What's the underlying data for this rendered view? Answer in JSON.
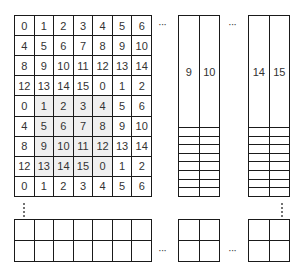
{
  "diagram": {
    "main_grid": {
      "columns": 7,
      "rows": [
        [
          "0",
          "1",
          "2",
          "3",
          "4",
          "5",
          "6"
        ],
        [
          "4",
          "5",
          "6",
          "7",
          "8",
          "9",
          "10"
        ],
        [
          "8",
          "9",
          "10",
          "11",
          "12",
          "13",
          "14"
        ],
        [
          "12",
          "13",
          "14",
          "15",
          "0",
          "1",
          "2"
        ],
        [
          "0",
          "1",
          "2",
          "3",
          "4",
          "5",
          "6"
        ],
        [
          "4",
          "5",
          "6",
          "7",
          "8",
          "9",
          "10"
        ],
        [
          "8",
          "9",
          "10",
          "11",
          "12",
          "13",
          "14"
        ],
        [
          "12",
          "13",
          "14",
          "15",
          "0",
          "1",
          "2"
        ],
        [
          "0",
          "1",
          "2",
          "3",
          "4",
          "5",
          "6"
        ]
      ],
      "shaded_region": {
        "rows": [
          4,
          5,
          6,
          7
        ],
        "cols": [
          1,
          2,
          3,
          4
        ],
        "color": "#efefef"
      }
    },
    "column_block_2": {
      "header": [
        "9",
        "10"
      ],
      "empty_rows": 8
    },
    "column_block_3": {
      "header": [
        "14",
        "15"
      ],
      "empty_rows": 8
    },
    "bottom_row_blocks": {
      "rows": 2,
      "block_1_cols": 7,
      "block_2_cols": 2,
      "block_3_cols": 2
    },
    "ellipsis_h": "···",
    "ellipsis_v": "⋮",
    "colors": {
      "border": "#1a1a1a",
      "text": "#333333",
      "shade": "#efefef",
      "background": "#ffffff"
    }
  }
}
